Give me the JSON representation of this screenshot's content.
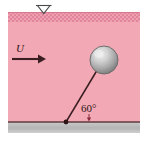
{
  "figure": {
    "labels": {
      "velocity": "U",
      "angle": "60°"
    },
    "colors": {
      "water": "#f2a7b3",
      "water_surface_hatch": "#e8899c",
      "ground": "#b8b8b8",
      "ground_line": "#5e3a3f",
      "sphere_dark": "#8d8d8d",
      "sphere_light": "#e2e2e2",
      "line": "#3a1e22",
      "background": "#ffffff"
    },
    "icons": {
      "free_surface": "free-surface-triangle-icon",
      "flow_arrow": "flow-direction-arrow-icon",
      "sphere": "sphere-icon",
      "tether": "tether-line-icon",
      "anchor": "anchor-point-icon",
      "angle_tick": "angle-tick-icon"
    },
    "geometry": {
      "sphere_center_x": 104,
      "sphere_center_y": 60,
      "sphere_radius": 14,
      "anchor_x": 66,
      "anchor_y": 122,
      "ground_y": 122,
      "water_top_y": 12,
      "water_left_x": 8,
      "water_right_x": 140
    }
  }
}
